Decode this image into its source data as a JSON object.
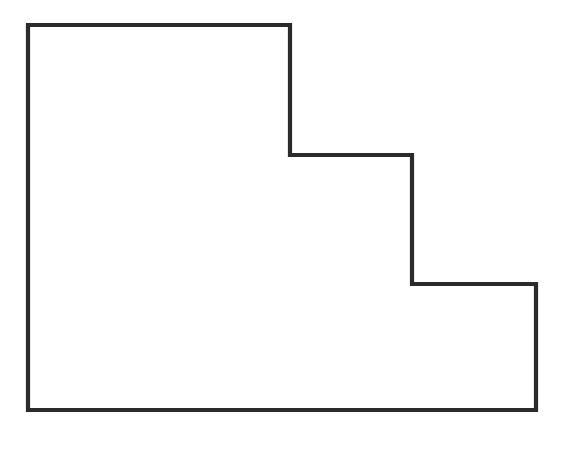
{
  "figure": {
    "background_color": "#ffffff",
    "outline_color": "#2b2b2b",
    "grid_color": "#6e6e6e",
    "outline_width": 4.2,
    "grid_width": 1.6
  },
  "chart_data": {
    "type": "diagram",
    "xlabel": "",
    "ylabel": "",
    "grid": true,
    "legend": false,
    "geometry": {
      "origin_px": [
        28,
        25
      ],
      "cell_width_px": 50.8,
      "cell_height_px": 48.1,
      "columns": 10,
      "rows": 8,
      "bounding_box_px": [
        28,
        25,
        536,
        410
      ]
    },
    "outline_vertices_px": [
      [
        28,
        25
      ],
      [
        290,
        25
      ],
      [
        290,
        155
      ],
      [
        412,
        155
      ],
      [
        412,
        284
      ],
      [
        536,
        284
      ],
      [
        536,
        410
      ],
      [
        28,
        410
      ]
    ],
    "steps": [
      {
        "name": "tall-left-block",
        "x_px": [
          28,
          290
        ],
        "y_px": [
          25,
          410
        ],
        "columns": [
          0,
          5
        ],
        "height_rows": 8
      },
      {
        "name": "middle-block",
        "x_px": [
          290,
          412
        ],
        "y_px": [
          155,
          410
        ],
        "columns": [
          5,
          8
        ],
        "height_rows": 5.3
      },
      {
        "name": "right-block",
        "x_px": [
          412,
          536
        ],
        "y_px": [
          284,
          410
        ],
        "columns": [
          8,
          10
        ],
        "height_rows": 2.6
      }
    ],
    "vertical_grid_x_px": [
      28,
      79,
      130,
      180,
      233,
      286,
      338,
      390,
      440,
      490,
      536
    ],
    "horizontal_grid_y_px": [
      25,
      72,
      106,
      155,
      203,
      251,
      284,
      326,
      372,
      410
    ],
    "interior_vertical_segments": [
      {
        "x_px": 79,
        "y_top_px": 25,
        "y_bottom_px": 410
      },
      {
        "x_px": 130,
        "y_top_px": 25,
        "y_bottom_px": 410
      },
      {
        "x_px": 180,
        "y_top_px": 25,
        "y_bottom_px": 410
      },
      {
        "x_px": 233,
        "y_top_px": 25,
        "y_bottom_px": 410
      },
      {
        "x_px": 338,
        "y_top_px": 155,
        "y_bottom_px": 410
      },
      {
        "x_px": 390,
        "y_top_px": 155,
        "y_bottom_px": 410
      },
      {
        "x_px": 440,
        "y_top_px": 284,
        "y_bottom_px": 410
      },
      {
        "x_px": 490,
        "y_top_px": 284,
        "y_bottom_px": 410
      }
    ],
    "interior_horizontal_segments": [
      {
        "y_px": 72,
        "x_left_px": 28,
        "x_right_px": 290
      },
      {
        "y_px": 106,
        "x_left_px": 28,
        "x_right_px": 290
      },
      {
        "y_px": 203,
        "x_left_px": 28,
        "x_right_px": 412
      },
      {
        "y_px": 251,
        "x_left_px": 28,
        "x_right_px": 412
      },
      {
        "y_px": 284,
        "x_left_px": 28,
        "x_right_px": 412
      },
      {
        "y_px": 326,
        "x_left_px": 28,
        "x_right_px": 536
      },
      {
        "y_px": 372,
        "x_left_px": 28,
        "x_right_px": 536
      },
      {
        "y_px": 155,
        "x_left_px": 28,
        "x_right_px": 290
      }
    ]
  }
}
